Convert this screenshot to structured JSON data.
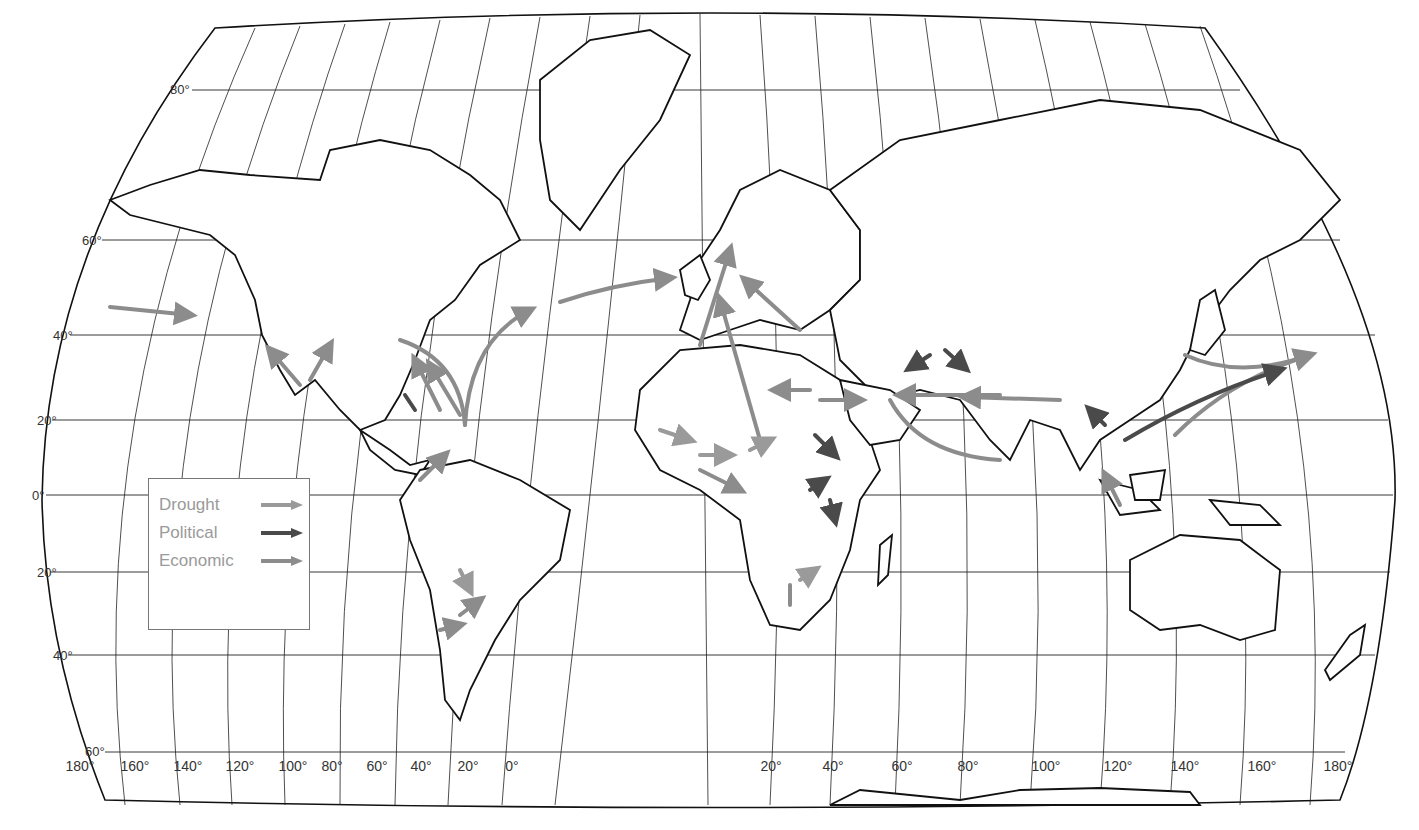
{
  "map": {
    "title": "World migration map",
    "projection": "Robinson-like world projection"
  },
  "latitude_labels": [
    {
      "label": "80°",
      "x": 170,
      "y": 82
    },
    {
      "label": "60°",
      "x": 82,
      "y": 233
    },
    {
      "label": "40°",
      "x": 53,
      "y": 328
    },
    {
      "label": "20°",
      "x": 37,
      "y": 413
    },
    {
      "label": "0°",
      "x": 32,
      "y": 488
    },
    {
      "label": "20°",
      "x": 37,
      "y": 565
    },
    {
      "label": "40°",
      "x": 53,
      "y": 648
    },
    {
      "label": "60°",
      "x": 85,
      "y": 744
    }
  ],
  "longitude_labels": [
    {
      "label": "180°",
      "x": 67
    },
    {
      "label": "160°",
      "x": 121
    },
    {
      "label": "140°",
      "x": 174
    },
    {
      "label": "120°",
      "x": 225
    },
    {
      "label": "100°",
      "x": 277
    },
    {
      "label": "80°",
      "x": 322
    },
    {
      "label": "60°",
      "x": 370
    },
    {
      "label": "40°",
      "x": 420
    },
    {
      "label": "20°",
      "x": 468
    },
    {
      "label": "0°",
      "x": 512
    },
    {
      "label": "20°",
      "x": 772
    },
    {
      "label": "40°",
      "x": 832
    },
    {
      "label": "60°",
      "x": 900
    },
    {
      "label": "80°",
      "x": 965
    },
    {
      "label": "100°",
      "x": 1046
    },
    {
      "label": "120°",
      "x": 1118
    },
    {
      "label": "140°",
      "x": 1185
    },
    {
      "label": "160°",
      "x": 1262
    },
    {
      "label": "180°",
      "x": 1338
    }
  ],
  "legend": {
    "items": [
      {
        "label": "Drought",
        "color": "#9a9a9a"
      },
      {
        "label": "Political",
        "color": "#4a4a4a"
      },
      {
        "label": "Economic",
        "color": "#8c8c8c"
      }
    ]
  },
  "colors": {
    "drought": "#9a9a9a",
    "political": "#4a4a4a",
    "economic": "#8c8c8c",
    "coastline": "#111111",
    "graticule": "#222222"
  }
}
